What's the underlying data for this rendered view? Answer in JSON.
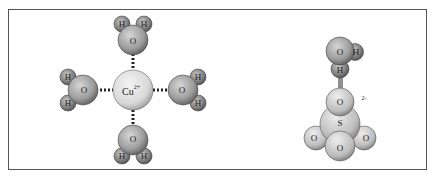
{
  "diagram": {
    "left_panel": {
      "central_ion": {
        "label": "Cu",
        "charge": "2+"
      },
      "ligands": [
        {
          "position": "top",
          "atoms": {
            "O": "O",
            "H1": "H",
            "H2": "H"
          }
        },
        {
          "position": "left",
          "atoms": {
            "O": "O",
            "H1": "H",
            "H2": "H"
          }
        },
        {
          "position": "right",
          "atoms": {
            "O": "O",
            "H1": "H",
            "H2": "H"
          }
        },
        {
          "position": "bottom",
          "atoms": {
            "O": "O",
            "H1": "H",
            "H2": "H"
          }
        }
      ],
      "bond_style": "dotted ion-dipole"
    },
    "right_panel": {
      "water": {
        "O": "O",
        "H1": "H",
        "H2": "H"
      },
      "sulfate": {
        "S": "S",
        "O_top": "O",
        "O_left": "O",
        "O_right": "O",
        "O_front": "O",
        "charge": "2-"
      },
      "bond_style": "hashed hydrogen bond"
    },
    "colors": {
      "frame": "#555555",
      "atom_light": "#e4e4e4",
      "atom_mid": "#a8a8a8",
      "atom_dark": "#6a6a6a",
      "bond": "#222222"
    }
  }
}
